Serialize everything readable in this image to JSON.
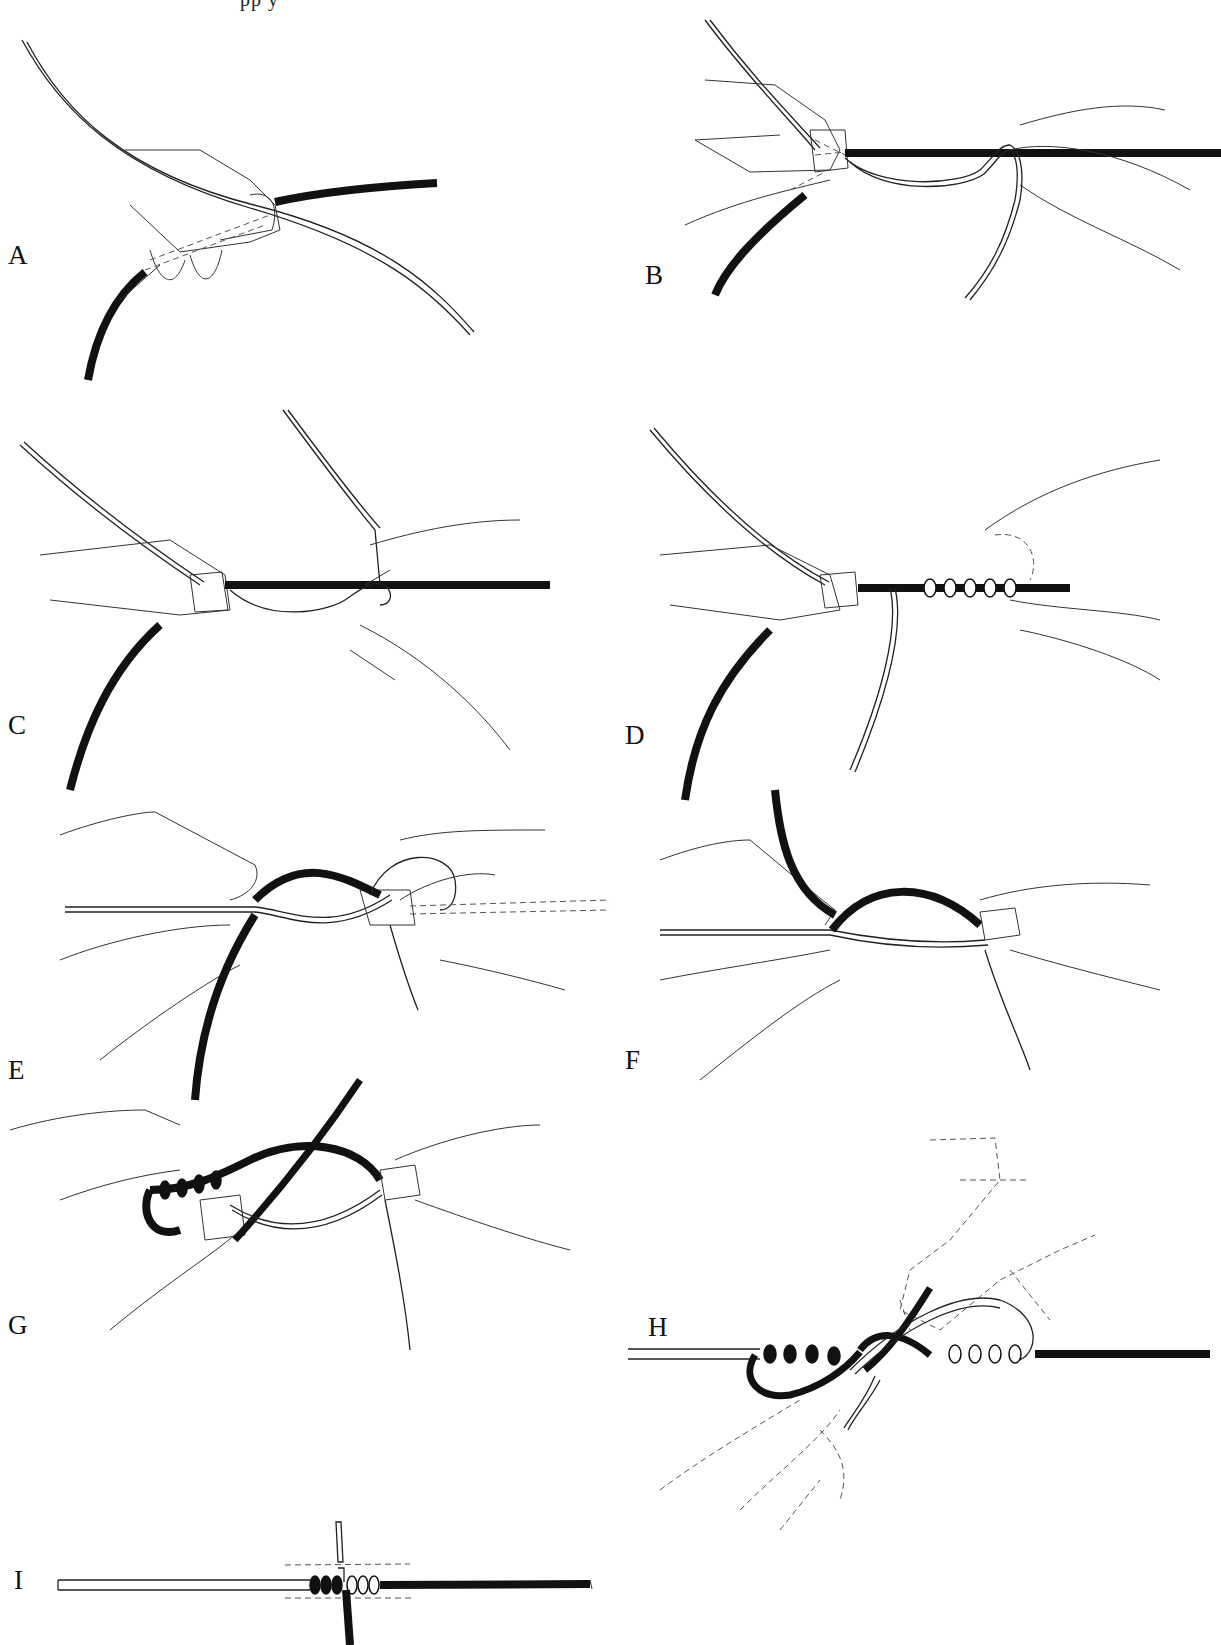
{
  "figure": {
    "cut_off_header_text": "pp y",
    "colors": {
      "background": "#ffffff",
      "ink": "#111111",
      "dark_line": "#111111",
      "light_line_outline": "#222222",
      "hand_outline": "#333333"
    },
    "panels": [
      {
        "label": "A",
        "description": "Two lines crossed and pinched between thumb and forefinger"
      },
      {
        "label": "B",
        "description": "Light line wrapped around dark line, held by second hand"
      },
      {
        "label": "C",
        "description": "Light line continues wrapping around dark line"
      },
      {
        "label": "D",
        "description": "Several turns of light line around dark line held in fingers"
      },
      {
        "label": "E",
        "description": "Turns pinched; dark line brought across to the other side"
      },
      {
        "label": "F",
        "description": "Dark line end brought up and pinched at crossing"
      },
      {
        "label": "G",
        "description": "Dark line wrapped around light line in opposite direction"
      },
      {
        "label": "H",
        "description": "Both ends passed through center opening; hands shown dashed"
      },
      {
        "label": "I",
        "description": "Finished knot with ends trimmed; dashed lines indicate trim points"
      }
    ]
  }
}
